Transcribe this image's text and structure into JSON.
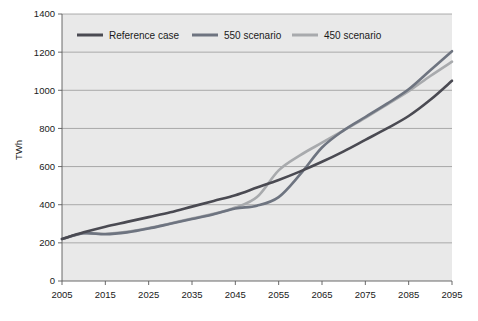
{
  "chart_data": {
    "type": "line",
    "title": "",
    "subtitle": "",
    "xlabel": "",
    "ylabel": "TWh",
    "xlim": [
      2005,
      2095
    ],
    "ylim": [
      0,
      1400
    ],
    "grid": true,
    "legend_position": "top-inside",
    "x_tick_labels": [
      "2005",
      "2015",
      "2025",
      "2035",
      "2045",
      "2055",
      "2065",
      "2075",
      "2085",
      "2095"
    ],
    "x_ticks": [
      2005,
      2015,
      2025,
      2035,
      2045,
      2055,
      2065,
      2075,
      2085,
      2095
    ],
    "y_tick_labels": [
      "0",
      "200",
      "400",
      "600",
      "800",
      "1000",
      "1200",
      "1400"
    ],
    "y_ticks": [
      0,
      200,
      400,
      600,
      800,
      1000,
      1200,
      1400
    ],
    "x": [
      2005,
      2010,
      2015,
      2020,
      2025,
      2030,
      2035,
      2040,
      2045,
      2050,
      2055,
      2060,
      2065,
      2070,
      2075,
      2080,
      2085,
      2090,
      2095
    ],
    "series": [
      {
        "name": "Reference case",
        "color": "#4a4a52",
        "values": [
          220,
          255,
          285,
          310,
          335,
          360,
          390,
          420,
          450,
          490,
          530,
          575,
          625,
          680,
          740,
          800,
          865,
          950,
          1050
        ]
      },
      {
        "name": "550 scenario",
        "color": "#6e7480",
        "values": [
          220,
          250,
          245,
          255,
          275,
          300,
          325,
          350,
          380,
          395,
          440,
          560,
          700,
          790,
          860,
          930,
          1005,
          1105,
          1205
        ]
      },
      {
        "name": "450 scenario",
        "color": "#a8aaad",
        "values": [
          220,
          250,
          248,
          258,
          278,
          302,
          328,
          352,
          385,
          440,
          580,
          660,
          725,
          790,
          855,
          925,
          995,
          1075,
          1150
        ]
      }
    ]
  },
  "legend": {
    "items": [
      {
        "label": "Reference case",
        "color": "#4a4a52"
      },
      {
        "label": "550 scenario",
        "color": "#6e7480"
      },
      {
        "label": "450 scenario",
        "color": "#a8aaad"
      }
    ]
  },
  "axes": {
    "y_title": "TWh"
  }
}
